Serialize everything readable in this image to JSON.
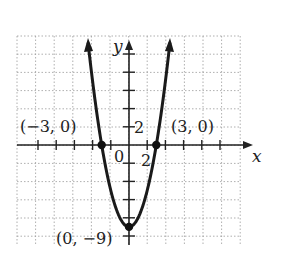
{
  "chart_data": {
    "type": "line",
    "title": "",
    "function": "y = x^2 - 9",
    "xlabel": "x",
    "ylabel": "y",
    "xlim": [
      -12,
      12
    ],
    "ylim": [
      -11,
      12
    ],
    "grid": true,
    "tick_step": 2,
    "tick_labels": {
      "x": "2",
      "y": "2",
      "origin": "0"
    },
    "points": [
      {
        "x": -3,
        "y": 0,
        "label": "(−3, 0)"
      },
      {
        "x": 3,
        "y": 0,
        "label": "(3, 0)"
      },
      {
        "x": 0,
        "y": -9,
        "label": "(0, −9)"
      }
    ],
    "series": [
      {
        "name": "parabola",
        "x": [
          -4.5,
          -4,
          -3,
          -2,
          -1,
          0,
          1,
          2,
          3,
          4,
          4.5
        ],
        "y": [
          11.25,
          7,
          0,
          -5,
          -8,
          -9,
          -8,
          -5,
          0,
          7,
          11.25
        ]
      }
    ]
  }
}
